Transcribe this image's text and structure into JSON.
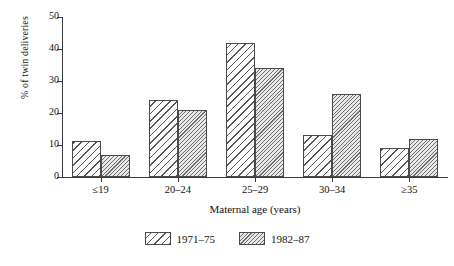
{
  "chart_data": {
    "type": "bar",
    "title": "",
    "xlabel": "Maternal age (years)",
    "ylabel": "% of twin deliveries",
    "categories": [
      "≤19",
      "20–24",
      "25–29",
      "30–34",
      "≥35"
    ],
    "series": [
      {
        "name": "1971–75",
        "values": [
          11.3,
          24.2,
          42,
          13.2,
          9
        ]
      },
      {
        "name": "1982–87",
        "values": [
          7,
          21,
          34,
          26,
          12
        ]
      }
    ],
    "ylim": [
      0,
      50
    ],
    "yticks": [
      0,
      10,
      20,
      30,
      40,
      50
    ],
    "ytick_labels": [
      "0",
      "10",
      "20",
      "30",
      "40",
      "50"
    ],
    "grid": false,
    "legend_position": "bottom-center"
  },
  "legend": {
    "items": [
      {
        "label": "1971–75",
        "pattern": "coarse-diagonal-hatch"
      },
      {
        "label": "1982–87",
        "pattern": "fine-diagonal-hatch"
      }
    ]
  },
  "colors": {
    "axis": "#3b3b3b",
    "bar_outline": "#4a4a4a",
    "series1_hatch": "#555555",
    "series2_hatch": "#6b6b6b",
    "series2_fill": "#e9e9e9",
    "text": "#111111"
  }
}
